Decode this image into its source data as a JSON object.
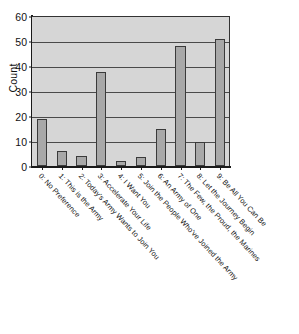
{
  "chart_data": {
    "type": "bar",
    "title": "",
    "subtitle": "",
    "xlabel": "",
    "ylabel": "Count",
    "ylim": [
      0,
      60
    ],
    "yticks": [
      0,
      10,
      20,
      30,
      40,
      50,
      60
    ],
    "ytick_labels": [
      "0",
      "10",
      "20",
      "30",
      "40",
      "50",
      "60"
    ],
    "grid": true,
    "legend": false,
    "orientation": "vertical",
    "bar_color": "#a8a8a8",
    "bar_edge_color": "#3a3a3a",
    "plot_background": "#d6d6d6",
    "categories": [
      "0: No Preference",
      "1: This is the Army",
      "2: Today's Army Wants to Join You",
      "3: Accelerate Your Life",
      "4: I Want You",
      "5: Join the People Who've Joined the Army",
      "6: An Army of One",
      "7: The Few, the Proud, the Marines",
      "8: Let the Journey Begin",
      "9: Be All You Can Be"
    ],
    "values": [
      19,
      6,
      4,
      37.5,
      2,
      3.5,
      15,
      48,
      9.5,
      51
    ]
  },
  "axes": {
    "y_title": "Count"
  }
}
